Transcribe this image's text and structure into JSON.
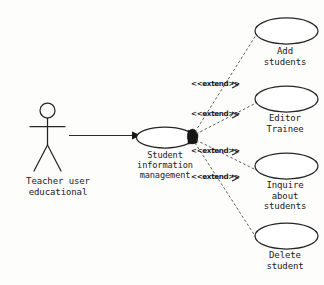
{
  "diagram": {
    "type": "uml-use-case-diagram",
    "background_color": "#fdfdfc",
    "line_color": "#262626",
    "actor": {
      "icon": "stick-figure-actor-icon",
      "label": "Teacher user\neducational",
      "label_line_1": "Teacher user",
      "label_line_2": "educational"
    },
    "system_use_case": {
      "label": "Student\ninformation\nmanagement",
      "line_1": "Student",
      "line_2": "information",
      "line_3": "management"
    },
    "association": {
      "style": "solid-arrow",
      "from": "Teacher user educational",
      "to": "Student information management"
    },
    "junction": {
      "name": "extend-junction-point",
      "style": "filled-blob"
    },
    "extend_relationships": [
      {
        "stereotype": "<<extend>>",
        "target": "Add students",
        "line_style": "dashed"
      },
      {
        "stereotype": "<<extend>>",
        "target": "Editor Trainee",
        "line_style": "dashed"
      },
      {
        "stereotype": "<<extend>>",
        "target": "Inquire about students",
        "line_style": "dashed"
      },
      {
        "stereotype": "<<extend>>",
        "target": "Delete student",
        "line_style": "dashed"
      }
    ],
    "use_cases": [
      {
        "id": "add-students",
        "label": "Add\nstudents",
        "line_1": "Add",
        "line_2": "students",
        "line_3": ""
      },
      {
        "id": "editor-trainee",
        "label": "Editor\nTrainee",
        "line_1": "Editor",
        "line_2": "Trainee",
        "line_3": ""
      },
      {
        "id": "inquire-about-students",
        "label": "Inquire\nabout\nstudents",
        "line_1": "Inquire",
        "line_2": "about",
        "line_3": "students"
      },
      {
        "id": "delete-student",
        "label": "Delete\nstudent",
        "line_1": "Delete",
        "line_2": "student",
        "line_3": ""
      }
    ],
    "caption": {
      "text": ""
    }
  }
}
